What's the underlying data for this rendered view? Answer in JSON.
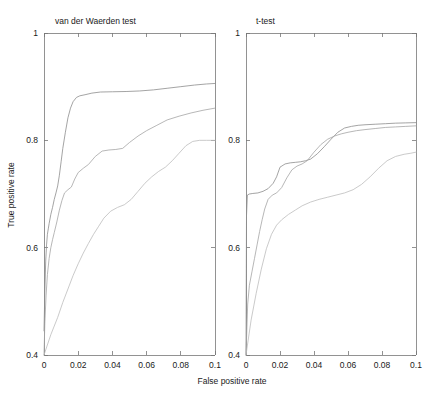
{
  "figure": {
    "axis_titles": {
      "x": "False positive rate",
      "y": "True positive rate"
    }
  },
  "chart_data": [
    {
      "type": "line",
      "title": "van der Waerden test",
      "panel": "left",
      "xlabel": "False positive rate",
      "ylabel": "True positive rate",
      "xlim": [
        0,
        0.1
      ],
      "ylim": [
        0.4,
        1
      ],
      "xticks": [
        0,
        0.02,
        0.04,
        0.06,
        0.08,
        0.1
      ],
      "xtick_labels": [
        "0",
        "0.02",
        "0.04",
        "0.06",
        "0.08",
        "0.1"
      ],
      "yticks": [
        0.4,
        0.6,
        0.8,
        1
      ],
      "ytick_labels": [
        "0.4",
        "0.6",
        "0.8",
        "1"
      ],
      "grid": false,
      "legend": "none",
      "series": [
        {
          "name": "curve-1",
          "x": [
            0.0,
            0.0005,
            0.001,
            0.0015,
            0.002,
            0.0025,
            0.003,
            0.004,
            0.005,
            0.006,
            0.007,
            0.008,
            0.009,
            0.01,
            0.011,
            0.0125,
            0.014,
            0.0155,
            0.017,
            0.019,
            0.021,
            0.024,
            0.028,
            0.033,
            0.04,
            0.048,
            0.056,
            0.064,
            0.072,
            0.08,
            0.088,
            0.095,
            0.1
          ],
          "y": [
            0.445,
            0.52,
            0.575,
            0.605,
            0.625,
            0.635,
            0.645,
            0.662,
            0.675,
            0.69,
            0.702,
            0.715,
            0.735,
            0.76,
            0.785,
            0.815,
            0.842,
            0.86,
            0.872,
            0.88,
            0.883,
            0.885,
            0.888,
            0.89,
            0.8905,
            0.891,
            0.892,
            0.894,
            0.897,
            0.9,
            0.903,
            0.905,
            0.906
          ]
        },
        {
          "name": "curve-2",
          "x": [
            0.0,
            0.0005,
            0.0012,
            0.002,
            0.003,
            0.004,
            0.005,
            0.006,
            0.0075,
            0.009,
            0.0105,
            0.012,
            0.014,
            0.016,
            0.018,
            0.02,
            0.023,
            0.026,
            0.03,
            0.034,
            0.038,
            0.042,
            0.046,
            0.05,
            0.055,
            0.06,
            0.066,
            0.072,
            0.079,
            0.086,
            0.093,
            0.1
          ],
          "y": [
            0.4,
            0.46,
            0.51,
            0.55,
            0.58,
            0.6,
            0.615,
            0.628,
            0.648,
            0.67,
            0.688,
            0.702,
            0.708,
            0.713,
            0.728,
            0.74,
            0.748,
            0.755,
            0.77,
            0.78,
            0.782,
            0.783,
            0.785,
            0.796,
            0.808,
            0.818,
            0.828,
            0.838,
            0.845,
            0.851,
            0.856,
            0.86
          ]
        },
        {
          "name": "curve-3",
          "x": [
            0.0,
            0.004,
            0.008,
            0.011,
            0.014,
            0.017,
            0.02,
            0.023,
            0.026,
            0.029,
            0.032,
            0.035,
            0.039,
            0.043,
            0.047,
            0.051,
            0.055,
            0.059,
            0.063,
            0.067,
            0.071,
            0.075,
            0.079,
            0.083,
            0.087,
            0.091,
            0.095,
            0.1
          ],
          "y": [
            0.4,
            0.438,
            0.47,
            0.498,
            0.523,
            0.548,
            0.57,
            0.59,
            0.608,
            0.625,
            0.64,
            0.655,
            0.668,
            0.675,
            0.68,
            0.69,
            0.705,
            0.72,
            0.732,
            0.742,
            0.75,
            0.762,
            0.776,
            0.79,
            0.798,
            0.8,
            0.8,
            0.8
          ]
        }
      ]
    },
    {
      "type": "line",
      "title": "t-test",
      "panel": "right",
      "xlabel": "False positive rate",
      "ylabel": "True positive rate",
      "xlim": [
        0,
        0.1
      ],
      "ylim": [
        0.4,
        1
      ],
      "xticks": [
        0,
        0.02,
        0.04,
        0.06,
        0.08,
        0.1
      ],
      "xtick_labels": [
        "0",
        "0.02",
        "0.04",
        "0.06",
        "0.08",
        "0.1"
      ],
      "yticks": [
        0.4,
        0.6,
        0.8,
        1
      ],
      "ytick_labels": [
        "0.4",
        "0.6",
        "0.8",
        "1"
      ],
      "grid": false,
      "legend": "none",
      "series": [
        {
          "name": "curve-1",
          "x": [
            0.0,
            0.0003,
            0.0008,
            0.002,
            0.004,
            0.007,
            0.01,
            0.013,
            0.016,
            0.018,
            0.02,
            0.023,
            0.026,
            0.029,
            0.032,
            0.035,
            0.038,
            0.042,
            0.046,
            0.05,
            0.054,
            0.058,
            0.062,
            0.066,
            0.07,
            0.076,
            0.082,
            0.088,
            0.094,
            0.1
          ],
          "y": [
            0.4,
            0.66,
            0.698,
            0.7,
            0.701,
            0.702,
            0.705,
            0.71,
            0.72,
            0.732,
            0.75,
            0.756,
            0.758,
            0.759,
            0.76,
            0.762,
            0.765,
            0.775,
            0.788,
            0.802,
            0.815,
            0.823,
            0.826,
            0.828,
            0.829,
            0.83,
            0.831,
            0.832,
            0.8325,
            0.833
          ]
        },
        {
          "name": "curve-2",
          "x": [
            0.0,
            0.001,
            0.002,
            0.0035,
            0.005,
            0.0065,
            0.008,
            0.0095,
            0.011,
            0.013,
            0.0155,
            0.018,
            0.021,
            0.024,
            0.027,
            0.03,
            0.033,
            0.036,
            0.04,
            0.044,
            0.048,
            0.052,
            0.056,
            0.06,
            0.065,
            0.07,
            0.076,
            0.082,
            0.088,
            0.094,
            0.1
          ],
          "y": [
            0.4,
            0.495,
            0.53,
            0.555,
            0.58,
            0.605,
            0.63,
            0.652,
            0.672,
            0.69,
            0.698,
            0.702,
            0.712,
            0.73,
            0.745,
            0.752,
            0.756,
            0.762,
            0.778,
            0.792,
            0.802,
            0.808,
            0.812,
            0.815,
            0.818,
            0.82,
            0.822,
            0.824,
            0.825,
            0.826,
            0.827
          ]
        },
        {
          "name": "curve-3",
          "x": [
            0.0,
            0.003,
            0.006,
            0.009,
            0.012,
            0.015,
            0.018,
            0.021,
            0.025,
            0.029,
            0.033,
            0.038,
            0.043,
            0.048,
            0.053,
            0.058,
            0.063,
            0.068,
            0.073,
            0.078,
            0.083,
            0.088,
            0.093,
            0.097,
            0.1
          ],
          "y": [
            0.4,
            0.465,
            0.515,
            0.56,
            0.598,
            0.625,
            0.642,
            0.652,
            0.662,
            0.67,
            0.678,
            0.685,
            0.69,
            0.694,
            0.698,
            0.702,
            0.708,
            0.718,
            0.732,
            0.748,
            0.762,
            0.77,
            0.774,
            0.776,
            0.778
          ]
        }
      ]
    }
  ]
}
